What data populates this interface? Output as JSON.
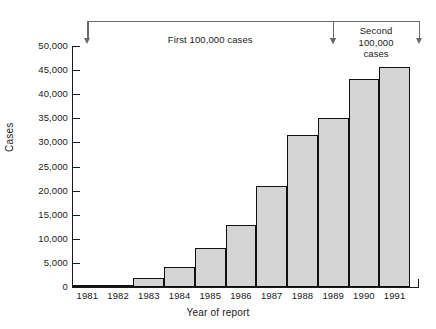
{
  "chart_data": {
    "type": "bar",
    "title": "",
    "xlabel": "Year of report",
    "ylabel": "Cases",
    "categories": [
      "1981",
      "1982",
      "1983",
      "1984",
      "1985",
      "1986",
      "1987",
      "1988",
      "1989",
      "1990",
      "1991"
    ],
    "values": [
      100,
      500,
      1900,
      4200,
      8100,
      12900,
      21000,
      31500,
      35000,
      43200,
      45700
    ],
    "ylim": [
      0,
      50000
    ],
    "yticks": [
      0,
      5000,
      10000,
      15000,
      20000,
      25000,
      30000,
      35000,
      40000,
      45000,
      50000
    ],
    "ytick_labels": [
      "0",
      "5,000",
      "10,000",
      "15,000",
      "20,000",
      "25,000",
      "30,000",
      "35,000",
      "40,000",
      "45,000",
      "50,000"
    ],
    "grid": false,
    "legend": null,
    "bar_fill_color": "#d4d4d4",
    "bar_edge_color": "#111111",
    "annotations": [
      {
        "name": "first-100000-bracket",
        "text": "First 100,000 cases",
        "from_category": "1981",
        "to_category": "1989"
      },
      {
        "name": "second-100000-bracket",
        "text": "Second 100,000 cases",
        "text_lines": [
          "Second",
          "100,000",
          "cases"
        ],
        "from_category": "1989",
        "to_category": "1991"
      }
    ]
  }
}
